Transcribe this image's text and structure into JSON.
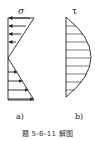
{
  "figure": {
    "caption": "题 5-6-11 解图",
    "panels": [
      {
        "id": "a",
        "label": "a)",
        "symbol": "σ",
        "description": "linear normal stress distribution, compression top, tension bottom"
      },
      {
        "id": "b",
        "label": "b)",
        "symbol": "τ",
        "description": "parabolic shear stress distribution"
      }
    ]
  }
}
